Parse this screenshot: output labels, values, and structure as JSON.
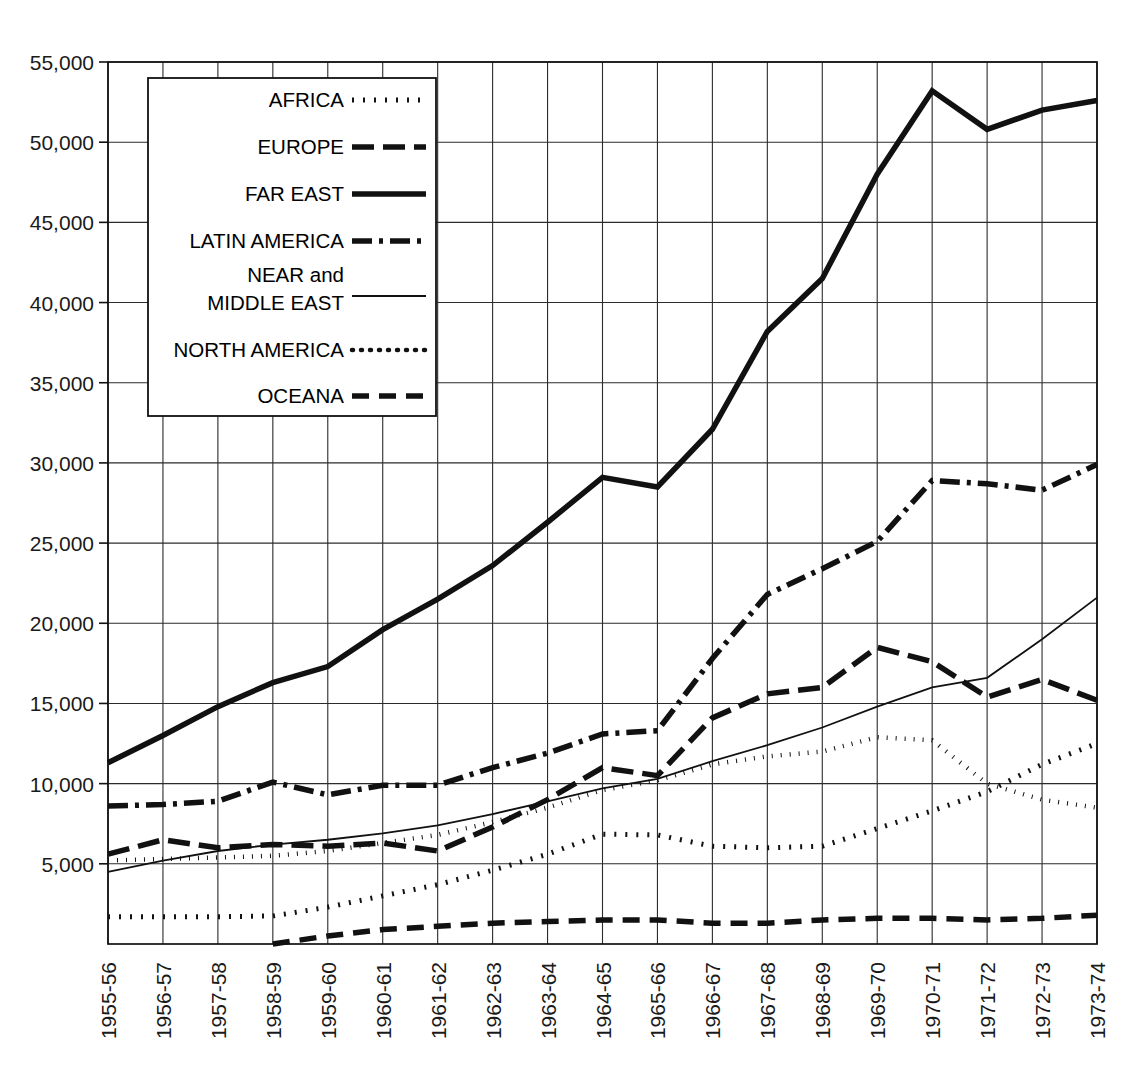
{
  "chart_data": {
    "type": "line",
    "title": "",
    "xlabel": "",
    "ylabel": "",
    "ylim": [
      0,
      55000
    ],
    "ytick_values": [
      5000,
      10000,
      15000,
      20000,
      25000,
      30000,
      35000,
      40000,
      45000,
      50000,
      55000
    ],
    "ytick_labels": [
      "5,000",
      "10,000",
      "15,000",
      "20,000",
      "25,000",
      "30,000",
      "35,000",
      "40,000",
      "45,000",
      "50,000",
      "55,000"
    ],
    "grid": true,
    "legend_position": "upper-left",
    "categories": [
      "1955-56",
      "1956-57",
      "1957-58",
      "1958-59",
      "1959-60",
      "1960-61",
      "1961-62",
      "1962-63",
      "1963-64",
      "1964-65",
      "1965-66",
      "1966-67",
      "1967-68",
      "1968-69",
      "1969-70",
      "1970-71",
      "1971-72",
      "1972-73",
      "1973-74"
    ],
    "series": [
      {
        "name": "AFRICA",
        "dash": "dotted-coarse",
        "width": 5,
        "dasharray": "2 9",
        "linecap": "butt",
        "values": [
          1700,
          1700,
          1700,
          1750,
          2300,
          3000,
          3700,
          4600,
          5600,
          6850,
          6800,
          6100,
          6000,
          6100,
          7200,
          8300,
          9500,
          11200,
          12500
        ]
      },
      {
        "name": "EUROPE",
        "dash": "long-dash",
        "width": 5.5,
        "dasharray": "22 9",
        "linecap": "butt",
        "values": [
          5600,
          6500,
          6000,
          6200,
          6100,
          6300,
          5800,
          7300,
          9000,
          11000,
          10500,
          14100,
          15600,
          16000,
          18500,
          17600,
          15400,
          16500,
          15200
        ]
      },
      {
        "name": "FAR EAST",
        "dash": "solid-thick",
        "width": 5.5,
        "dasharray": "",
        "linecap": "butt",
        "values": [
          11300,
          13000,
          14800,
          16300,
          17300,
          19600,
          21500,
          23600,
          26300,
          29100,
          28500,
          32100,
          38200,
          41500,
          48000,
          53200,
          50800,
          52000,
          52600
        ]
      },
      {
        "name": "LATIN AMERICA",
        "dash": "dash-dot",
        "width": 5.5,
        "dasharray": "20 7 4 7",
        "linecap": "butt",
        "values": [
          8600,
          8700,
          8900,
          10100,
          9300,
          9900,
          9900,
          11000,
          11900,
          13100,
          13300,
          17800,
          21800,
          23400,
          25100,
          28900,
          28700,
          28300,
          29900
        ]
      },
      {
        "name": "NEAR and MIDDLE EAST",
        "dash": "solid-thin",
        "width": 1.8,
        "dasharray": "",
        "linecap": "butt",
        "values": [
          4500,
          5200,
          5800,
          6200,
          6500,
          6900,
          7400,
          8100,
          8900,
          9700,
          10300,
          11400,
          12400,
          13500,
          14800,
          16000,
          16600,
          19000,
          21600
        ]
      },
      {
        "name": "NORTH AMERICA",
        "dash": "dotted-fine",
        "width": 4.5,
        "dasharray": "1 8",
        "linecap": "round",
        "values": [
          5200,
          5300,
          5400,
          5500,
          5800,
          6300,
          6800,
          7600,
          8500,
          9600,
          10200,
          11200,
          11700,
          12000,
          12900,
          12700,
          10000,
          9000,
          8500
        ]
      },
      {
        "name": "OCEANA",
        "dash": "medium-dash",
        "width": 5.5,
        "dasharray": "17 10",
        "linecap": "butt",
        "values": [
          null,
          null,
          null,
          0,
          500,
          900,
          1100,
          1300,
          1400,
          1500,
          1500,
          1300,
          1300,
          1500,
          1600,
          1600,
          1500,
          1600,
          1800
        ]
      }
    ]
  },
  "legend": {
    "items": [
      {
        "label": "AFRICA",
        "sample": "dotted-coarse"
      },
      {
        "label": "EUROPE",
        "sample": "long-dash"
      },
      {
        "label": "FAR EAST",
        "sample": "solid-thick"
      },
      {
        "label": "LATIN AMERICA",
        "sample": "dash-dot"
      },
      {
        "label": "NEAR and",
        "label2": "MIDDLE EAST",
        "sample": "solid-thin"
      },
      {
        "label": "NORTH AMERICA",
        "sample": "dotted-fine"
      },
      {
        "label": "OCEANA",
        "sample": "medium-dash"
      }
    ]
  },
  "colors": {
    "ink": "#111111",
    "grid": "#2b2b2b",
    "background": "#ffffff"
  }
}
